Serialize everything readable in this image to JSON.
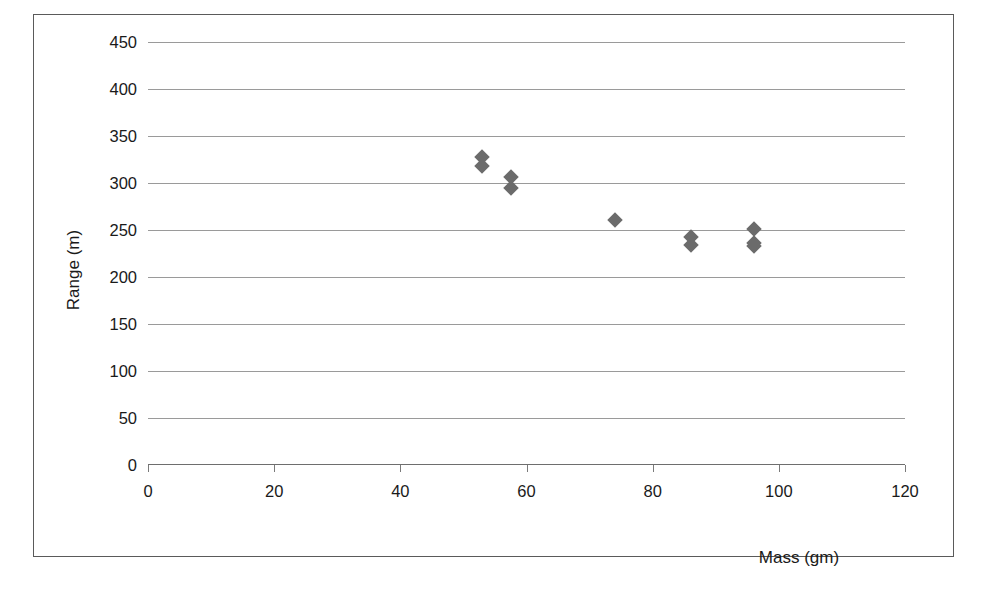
{
  "chart_data": {
    "type": "scatter",
    "title": "",
    "xlabel": "Mass (gm)",
    "ylabel": "Range (m)",
    "xlim": [
      0,
      120
    ],
    "ylim": [
      0,
      450
    ],
    "xticks": [
      0,
      20,
      40,
      60,
      80,
      100,
      120
    ],
    "yticks": [
      0,
      50,
      100,
      150,
      200,
      250,
      300,
      350,
      400,
      450
    ],
    "grid": "horizontal",
    "legend": "none",
    "marker_style": "diamond",
    "marker_color": "#6b6b6b",
    "series": [
      {
        "name": "Range vs Mass",
        "points": [
          {
            "x": 53,
            "y": 328
          },
          {
            "x": 53,
            "y": 318
          },
          {
            "x": 57.5,
            "y": 306
          },
          {
            "x": 57.5,
            "y": 295
          },
          {
            "x": 74,
            "y": 261
          },
          {
            "x": 86,
            "y": 243
          },
          {
            "x": 86,
            "y": 234
          },
          {
            "x": 96,
            "y": 251
          },
          {
            "x": 96,
            "y": 236
          },
          {
            "x": 96,
            "y": 233
          }
        ]
      }
    ]
  },
  "axes": {
    "y_title": "Range (m)",
    "x_title": "Mass (gm)",
    "y_tick_labels": [
      "450",
      "400",
      "350",
      "300",
      "250",
      "200",
      "150",
      "100",
      "50",
      "0"
    ],
    "x_tick_labels": [
      "0",
      "20",
      "40",
      "60",
      "80",
      "100",
      "120"
    ]
  }
}
